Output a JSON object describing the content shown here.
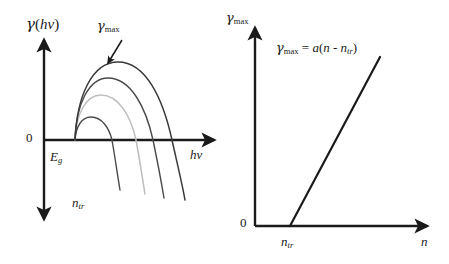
{
  "figure": {
    "caption_text": "",
    "background_color": "#ffffff",
    "width": 449,
    "height": 264
  },
  "panels": {
    "left": {
      "name": "gain-spectrum-panel",
      "y_axis_label": "γ(hν)",
      "y_axis_label_parts": {
        "symbol": "γ",
        "open": "(",
        "arg": "hν",
        "close": ")"
      },
      "x_axis_label": "hν",
      "origin_label": "0",
      "bandgap_label": "E",
      "bandgap_sub": "g",
      "peak_label": "γ",
      "peak_sub": "max",
      "carrier_label": "n",
      "carrier_sub": "tr",
      "curve_count": 4,
      "curve_colors": [
        "#3a3a3a",
        "#4a4a4a",
        "#bdbdbd",
        "#4a4a4a"
      ],
      "axis_color": "#1a1a1a"
    },
    "right": {
      "name": "peak-gain-vs-carrier-panel",
      "y_axis_label": "γ",
      "y_axis_sub": "max",
      "x_axis_label": "n",
      "origin_label": "0",
      "threshold_label": "n",
      "threshold_sub": "tr",
      "equation": "γmax = a(n - ntr)",
      "equation_parts": {
        "gamma": "γ",
        "gamma_sub": "max",
        "equals": "=",
        "slope": "a",
        "open": "(",
        "n": "n",
        "minus": "-",
        "n2": "n",
        "n2_sub": "tr",
        "close": ")"
      },
      "line_color": "#1a1a1a",
      "axis_color": "#1a1a1a"
    }
  },
  "chart_data": {
    "type": "line",
    "title": "",
    "subtitle": "",
    "panels": [
      {
        "id": "left",
        "title": "",
        "xlabel": "hν",
        "ylabel": "γ(hν)",
        "xlim": [
          0,
          1
        ],
        "ylim": [
          -1,
          1
        ],
        "grid": false,
        "legend": "none",
        "annotations": [
          {
            "text": "γmax",
            "x": 0.42,
            "y": 0.92,
            "type": "arrow-label"
          },
          {
            "text": "Eg",
            "x": 0.05,
            "y": -0.14,
            "type": "axis-mark"
          },
          {
            "text": "ntr",
            "x": 0.2,
            "y": -0.62,
            "type": "group-label"
          },
          {
            "text": "0",
            "x": -0.06,
            "y": 0.0,
            "type": "origin"
          }
        ],
        "series": [
          {
            "name": "curve-1-highest",
            "color": "#3a3a3a",
            "peak_value": 0.8,
            "zero_crossing_x": 0.77,
            "points_svg": "M 75,140 C 77,96 92,62 118,62 C 146,62 163,99 172,140 C 178,167 182,183 185,200"
          },
          {
            "name": "curve-2",
            "color": "#4a4a4a",
            "peak_value": 0.6,
            "zero_crossing_x": 0.64,
            "points_svg": "M 75,140 C 76,104 89,78 108,78 C 131,78 146,108 153,140 C 158,164 161,180 164,198"
          },
          {
            "name": "curve-3-light",
            "color": "#bdbdbd",
            "peak_value": 0.42,
            "zero_crossing_x": 0.5,
            "points_svg": "M 75,140 C 76,114 86,95 101,95 C 119,95 131,117 136,140 C 140,161 142,176 145,194"
          },
          {
            "name": "curve-4-lowest",
            "color": "#4a4a4a",
            "peak_value": 0.2,
            "zero_crossing_x": 0.3,
            "points_svg": "M 75,140 C 76,126 82,117 91,117 C 102,117 109,128 112,140 C 115,157 117,172 120,190"
          }
        ]
      },
      {
        "id": "right",
        "title": "",
        "xlabel": "n",
        "ylabel": "γmax",
        "xlim": [
          0,
          1
        ],
        "ylim": [
          0,
          1
        ],
        "grid": false,
        "legend": "none",
        "annotations": [
          {
            "text": "γmax = a(n - ntr)",
            "x": 0.25,
            "y": 0.85,
            "type": "equation"
          },
          {
            "text": "ntr",
            "x": 0.2,
            "y": -0.08,
            "type": "axis-mark"
          },
          {
            "text": "0",
            "x": -0.05,
            "y": 0.0,
            "type": "origin"
          }
        ],
        "series": [
          {
            "name": "linear-gain",
            "color": "#1a1a1a",
            "x": [
              0.2,
              0.72
            ],
            "y": [
              0.0,
              0.96
            ],
            "slope_label": "a",
            "x_intercept": 0.2,
            "points_svg": "M 290,226 L 380,57"
          }
        ]
      }
    ]
  }
}
